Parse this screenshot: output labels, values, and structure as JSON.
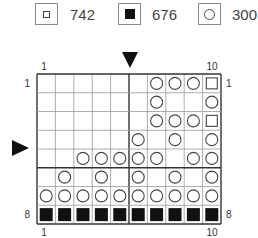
{
  "legend": [
    {
      "symbol": "square-outline",
      "label": "742"
    },
    {
      "symbol": "square-filled",
      "label": "676"
    },
    {
      "symbol": "circle-outline",
      "label": "300"
    }
  ],
  "chart": {
    "columns": 10,
    "rows": 8,
    "top_labels": {
      "first": "1",
      "last": "10"
    },
    "bottom_labels": {
      "first": "1",
      "last": "10"
    },
    "left_labels": {
      "first": "1",
      "last": "8"
    },
    "right_labels": {
      "first": "1",
      "last": "8"
    },
    "center_column_marker": "after column 5",
    "center_row_marker": "between rows 4 and 5",
    "divider_column_after": 5,
    "divider_row_after": 5,
    "legend_key": {
      "S": "742",
      "F": "676",
      "O": "300",
      ".": "empty"
    },
    "grid": [
      ". . . . . . O O O S",
      ". . . . . . O . . O",
      ". . . . . . O O O S",
      ". . . . . O . O . O",
      ". . O O O O O . O O",
      ". O . O . O . O . O",
      "O O O O O O O O O O",
      "F F F F F F F F F F"
    ]
  }
}
